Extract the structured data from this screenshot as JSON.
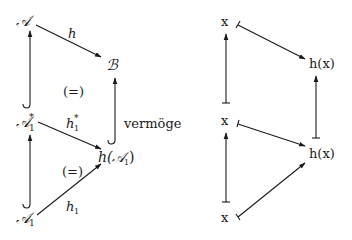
{
  "left_diagram": {
    "nodes": {
      "A": "𝒜",
      "B": "ℬ",
      "A1_star": "𝒜",
      "A1_star_sub": "1",
      "A1_star_sup": "*",
      "hA1_prefix": "h(",
      "hA1_set": "𝒜",
      "hA1_sub": "1",
      "hA1_suffix": ")",
      "A1": "𝒜",
      "A1_sub": "1"
    },
    "edge_labels": {
      "h": "h",
      "h1_star": "h",
      "h1_star_sub": "1",
      "h1_star_sup": "*",
      "h1": "h",
      "h1_sub": "1"
    },
    "commute_marks": [
      "(=)",
      "(=)"
    ],
    "side_label": "vermöge"
  },
  "right_diagram": {
    "nodes": {
      "x_top": "x",
      "hx_top": "h(x)",
      "x_mid": "x",
      "hx_bottom": "h(x)",
      "x_bottom": "x"
    }
  }
}
